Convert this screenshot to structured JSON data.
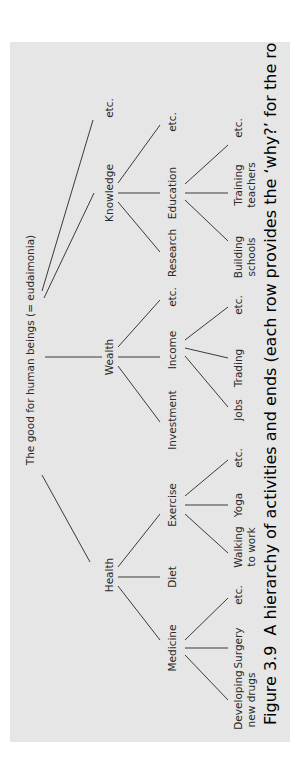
{
  "figure": {
    "orientation": "rotated-90-ccw",
    "colors": {
      "panel_bg": "#e6e6e6",
      "page_bg": "#ffffff",
      "ink": "#2a2a2a"
    },
    "root": {
      "label": "The good for human beings (= eudaimonia)"
    },
    "level2": [
      {
        "label": "Health"
      },
      {
        "label": "Wealth"
      },
      {
        "label": "Knowledge"
      },
      {
        "label": "etc."
      }
    ],
    "level3": [
      {
        "label": "Medicine",
        "parent": "Health"
      },
      {
        "label": "Diet",
        "parent": "Health"
      },
      {
        "label": "Exercise",
        "parent": "Health"
      },
      {
        "label": "Investment",
        "parent": "Wealth"
      },
      {
        "label": "Income",
        "parent": "Wealth"
      },
      {
        "label": "etc.",
        "parent": "Wealth"
      },
      {
        "label": "Research",
        "parent": "Knowledge"
      },
      {
        "label": "Education",
        "parent": "Knowledge"
      },
      {
        "label": "etc.",
        "parent": "Knowledge"
      }
    ],
    "level4": [
      {
        "line1": "Developing",
        "line2": "new drugs",
        "parent": "Medicine"
      },
      {
        "line1": "Surgery",
        "line2": "",
        "parent": "Medicine"
      },
      {
        "line1": "etc.",
        "line2": "",
        "parent": "Medicine"
      },
      {
        "line1": "Walking",
        "line2": "to work",
        "parent": "Exercise"
      },
      {
        "line1": "Yoga",
        "line2": "",
        "parent": "Exercise"
      },
      {
        "line1": "etc.",
        "line2": "",
        "parent": "Exercise"
      },
      {
        "line1": "Jobs",
        "line2": "",
        "parent": "Income"
      },
      {
        "line1": "Trading",
        "line2": "",
        "parent": "Income"
      },
      {
        "line1": "etc.",
        "line2": "",
        "parent": "Income"
      },
      {
        "line1": "Building",
        "line2": "schools",
        "parent": "Education"
      },
      {
        "line1": "Training",
        "line2": "teachers",
        "parent": "Education"
      },
      {
        "line1": "etc.",
        "line2": "",
        "parent": "Education"
      }
    ],
    "caption": {
      "number": "Figure 3.9",
      "text": "A hierarchy of activities and ends (each row provides the ‘why?’ for the row below)"
    }
  }
}
